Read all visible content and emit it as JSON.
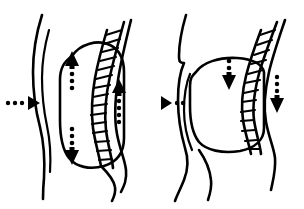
{
  "figure": {
    "background_color": "#ffffff",
    "ink_color": "#000000",
    "width": 304,
    "height": 209,
    "style": "black-and-white line art, no text labels",
    "panel_count": 2
  },
  "panels": [
    {
      "id": "left-panel",
      "name": "inhalation-expanded-state",
      "caption": "",
      "state": "expanded",
      "bounds": {
        "x": 0,
        "y": 0,
        "width": 152,
        "height": 209
      },
      "organ": {
        "name": "abdominal-cavity-outline",
        "shape": "tall rounded vertical oval",
        "fill": "#ffffff",
        "outline": "#000000"
      },
      "spine": {
        "name": "segmented-spinal-column",
        "orientation": "right side, curving",
        "segment_count": 13,
        "shape": "ladder of stacked quadrilateral vertebrae"
      },
      "arrows": [
        {
          "name": "lateral-expansion-arrow",
          "direction": "right",
          "position": "outer left side",
          "dot_count": 3,
          "meaning": "outward lateral expansion"
        },
        {
          "name": "superior-expansion-arrow",
          "direction": "up",
          "position": "inside organ, upper",
          "dot_count": 3,
          "meaning": "upward expansion"
        },
        {
          "name": "inferior-expansion-arrow",
          "direction": "down",
          "position": "inside organ, lower",
          "dot_count": 3,
          "meaning": "downward expansion"
        },
        {
          "name": "posterior-expansion-arrow",
          "direction": "up",
          "position": "right of spine",
          "dot_count": 4,
          "meaning": "posterior upward expansion"
        }
      ]
    },
    {
      "id": "right-panel",
      "name": "exhalation-compressed-state",
      "caption": "",
      "state": "compressed",
      "bounds": {
        "x": 152,
        "y": 0,
        "width": 152,
        "height": 209
      },
      "organ": {
        "name": "abdominal-cavity-outline",
        "shape": "short rounded compressed oval",
        "fill": "#ffffff",
        "outline": "#000000"
      },
      "spine": {
        "name": "segmented-spinal-column",
        "orientation": "right side, curving",
        "segment_count": 12,
        "shape": "ladder of stacked quadrilateral vertebrae"
      },
      "arrows": [
        {
          "name": "lateral-contraction-arrow",
          "direction": "left",
          "position": "outer left side",
          "dot_count": 2,
          "meaning": "inward lateral recoil"
        },
        {
          "name": "superior-contraction-arrow",
          "direction": "down",
          "position": "inside organ, upper",
          "dot_count": 2,
          "meaning": "downward compression from above"
        },
        {
          "name": "posterior-contraction-arrow",
          "direction": "down",
          "position": "right of spine",
          "dot_count": 3,
          "meaning": "posterior downward compression"
        }
      ]
    }
  ]
}
